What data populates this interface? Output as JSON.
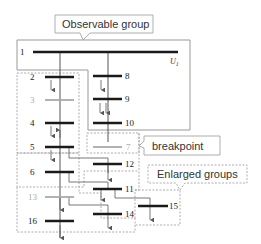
{
  "callouts": {
    "observable": "Observable group",
    "breakpoint": "breakpoint",
    "enlarged": "Enlarged groups"
  },
  "voltage_label": "U",
  "voltage_sub": "1",
  "buses": [
    {
      "id": "1",
      "label": "1",
      "state": "observable"
    },
    {
      "id": "2",
      "label": "2",
      "state": "observable"
    },
    {
      "id": "3",
      "label": "3",
      "state": "unobserved"
    },
    {
      "id": "4",
      "label": "4",
      "state": "observable"
    },
    {
      "id": "5",
      "label": "5",
      "state": "observable"
    },
    {
      "id": "6",
      "label": "6",
      "state": "observable"
    },
    {
      "id": "7",
      "label": "7",
      "state": "breakpoint"
    },
    {
      "id": "8",
      "label": "8",
      "state": "observable"
    },
    {
      "id": "9",
      "label": "9",
      "state": "observable"
    },
    {
      "id": "10",
      "label": "10",
      "state": "observable"
    },
    {
      "id": "11",
      "label": "11",
      "state": "observable"
    },
    {
      "id": "12",
      "label": "12",
      "state": "observable"
    },
    {
      "id": "13",
      "label": "13",
      "state": "unobserved"
    },
    {
      "id": "14",
      "label": "14",
      "state": "observable"
    },
    {
      "id": "15",
      "label": "15",
      "state": "observable"
    },
    {
      "id": "16",
      "label": "16",
      "state": "observable"
    }
  ],
  "colors": {
    "bus": "#1a1a1a",
    "bus_grey": "#aaaaaa",
    "line": "#555555",
    "box": "#999999"
  }
}
